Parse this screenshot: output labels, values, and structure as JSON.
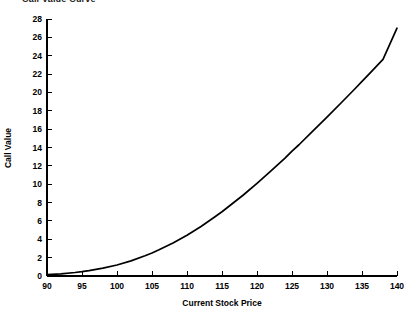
{
  "chart_data": {
    "type": "line",
    "title": "Call Value Curve",
    "xlabel": "Current Stock Price",
    "ylabel": "Call Value",
    "xlim": [
      90,
      140
    ],
    "ylim": [
      0,
      28
    ],
    "xticks": [
      90,
      95,
      100,
      105,
      110,
      115,
      120,
      125,
      130,
      135,
      140
    ],
    "yticks": [
      0,
      2,
      4,
      6,
      8,
      10,
      12,
      14,
      16,
      18,
      20,
      22,
      24,
      26,
      28
    ],
    "grid": false,
    "legend": null,
    "series": [
      {
        "name": "Call Value",
        "color": "#000000",
        "x": [
          90,
          92,
          94,
          95,
          96,
          98,
          100,
          102,
          104,
          105,
          106,
          108,
          110,
          112,
          114,
          115,
          116,
          118,
          120,
          122,
          124,
          125,
          126,
          128,
          130,
          132,
          134,
          135,
          136,
          138,
          140
        ],
        "values": [
          0.15,
          0.24,
          0.38,
          0.47,
          0.58,
          0.85,
          1.2,
          1.65,
          2.2,
          2.5,
          2.85,
          3.6,
          4.45,
          5.4,
          6.45,
          7.0,
          7.6,
          8.8,
          10.1,
          11.45,
          12.85,
          13.6,
          14.3,
          15.8,
          17.3,
          18.85,
          20.4,
          21.2,
          22.0,
          23.6,
          27.0
        ]
      }
    ]
  },
  "axes": {
    "y_axis_title": "Call Value",
    "x_axis_title": "Current Stock Price"
  }
}
